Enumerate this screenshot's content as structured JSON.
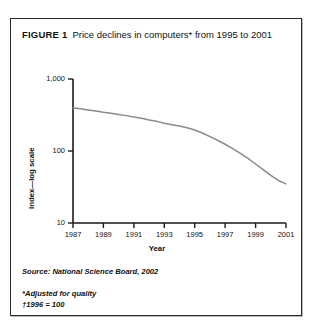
{
  "figure": {
    "label": "FIGURE 1",
    "caption": "Price declines in computers* from 1995 to 2001"
  },
  "notes": {
    "source": "Source: National Science Board, 2002",
    "footnote_asterisk": "*Adjusted for quality",
    "footnote_dagger": "†1996 = 100"
  },
  "colors": {
    "line": "#8a8a8a",
    "axis": "#1a1a1a",
    "border": "#2b2b2b",
    "text": "#111111",
    "background": "#ffffff"
  },
  "chart_data": {
    "type": "line",
    "title": "Price declines in computers* from 1995 to 2001",
    "xlabel": "Year",
    "ylabel": "Index—log scale",
    "yscale": "log",
    "ylim": [
      10,
      1000
    ],
    "ytick_labels": [
      "1,000",
      "100",
      "10"
    ],
    "ytick_values": [
      1000,
      100,
      10
    ],
    "xlim": [
      1987,
      2001
    ],
    "xtick_labels": [
      "1987",
      "1989",
      "1991",
      "1993",
      "1995",
      "1997",
      "1999",
      "2001"
    ],
    "xtick_values": [
      1987,
      1989,
      1991,
      1993,
      1995,
      1997,
      1999,
      2001
    ],
    "grid": false,
    "legend": false,
    "series": [
      {
        "name": "Computer price index (1996 = 100)",
        "x": [
          1987,
          1987.5,
          1988,
          1988.5,
          1989,
          1989.5,
          1990,
          1990.5,
          1991,
          1991.5,
          1992,
          1992.5,
          1993,
          1993.5,
          1994,
          1994.5,
          1995,
          1995.5,
          1996,
          1996.5,
          1997,
          1997.5,
          1998,
          1998.5,
          1999,
          1999.5,
          2000,
          2000.5,
          2001
        ],
        "values": [
          395,
          385,
          372,
          360,
          345,
          335,
          322,
          310,
          296,
          285,
          270,
          258,
          243,
          232,
          222,
          210,
          196,
          178,
          158,
          141,
          124,
          108,
          93,
          79,
          66,
          55,
          46,
          39,
          35
        ]
      }
    ]
  }
}
